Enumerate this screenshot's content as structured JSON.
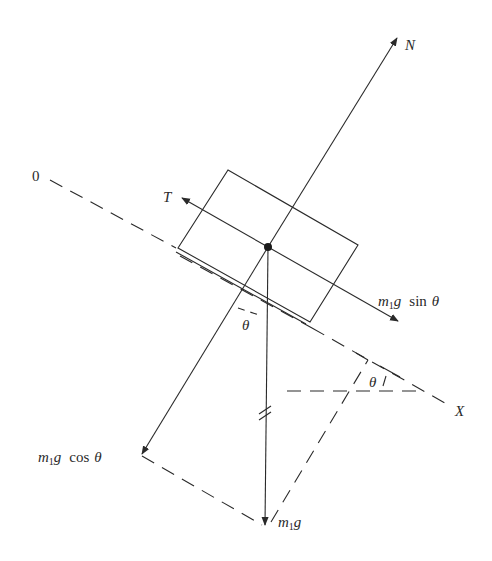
{
  "diagram": {
    "colors": {
      "ink": "#2a2a2a",
      "background": "#ffffff"
    },
    "labels": {
      "origin": "0",
      "axis_x": "X",
      "normal": "N",
      "tension": "T",
      "weight_m": "m",
      "weight_sub": "1",
      "weight_g": "g",
      "sin_text": "sin",
      "cos_text": "cos",
      "theta": "θ",
      "theta_lower": "θ",
      "theta_right": "θ"
    },
    "forces": [
      {
        "name": "N",
        "direction": "normal, up the perpendicular"
      },
      {
        "name": "T",
        "direction": "up the incline"
      },
      {
        "name": "m1g sin θ",
        "direction": "down the incline"
      },
      {
        "name": "m1g cos θ",
        "direction": "into the incline"
      },
      {
        "name": "m1g",
        "direction": "vertically down"
      }
    ]
  }
}
